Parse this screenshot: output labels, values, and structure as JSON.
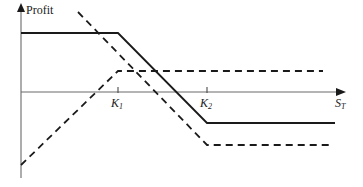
{
  "figure": {
    "title": "",
    "y_axis_label": "Profit",
    "x_axis_label_base": "S",
    "x_axis_label_sub": "T",
    "tick_k1_base": "K",
    "tick_k1_sub": "1",
    "tick_k2_base": "K",
    "tick_k2_sub": "2",
    "line_color": "#1a1a1a",
    "axis_color": "#555555",
    "background_color": "#ffffff"
  },
  "chart_data": {
    "type": "line",
    "title": "",
    "subtitle": "",
    "xlabel": "S_T",
    "ylabel": "Profit",
    "grid": false,
    "legend": "none",
    "axis_origin": {
      "x": 21,
      "y": 92
    },
    "x_axis_end": 345,
    "y_axis_top": 5,
    "y_axis_bottom": 178,
    "xticks": [
      {
        "label": "K1",
        "x_px": 118
      },
      {
        "label": "K2",
        "x_px": 207
      }
    ],
    "ylim_px": [
      178,
      5
    ],
    "xlim_px": [
      21,
      345
    ],
    "series": [
      {
        "name": "bear-spread-combined-payoff",
        "style": "solid",
        "color": "#1a1a1a",
        "width": 1.8,
        "points_px": [
          [
            21,
            33
          ],
          [
            118,
            33
          ],
          [
            207,
            123
          ],
          [
            335,
            123
          ]
        ],
        "description": "Solid line: flat max profit until K1, declines linearly between K1 and K2, flat max loss after K2."
      },
      {
        "name": "long-call-k2-payoff",
        "style": "dashed",
        "color": "#1a1a1a",
        "width": 1.8,
        "points_px": [
          [
            21,
            165
          ],
          [
            118,
            71
          ],
          [
            323,
            71
          ]
        ],
        "description": "Dashed line rising from below axis on the y-axis, peaking at K1 level then flat above axis."
      },
      {
        "name": "short-call-k1-payoff",
        "style": "dashed",
        "color": "#1a1a1a",
        "width": 1.8,
        "points_px": [
          [
            78,
            12
          ],
          [
            207,
            145
          ],
          [
            330,
            145
          ]
        ],
        "description": "Dashed line declining from upper-left through the axis, flattening after K2 below the axis."
      }
    ]
  }
}
